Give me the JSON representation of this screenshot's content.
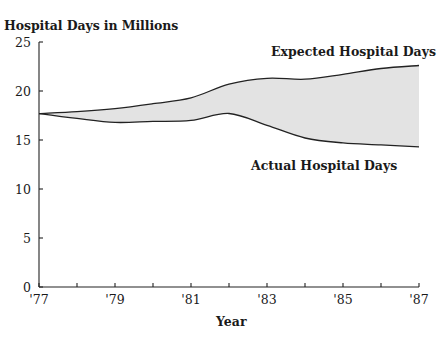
{
  "chart_data": {
    "type": "area",
    "title": "Hospital Days in Millions",
    "xlabel": "Year",
    "ylabel": "Hospital Days in Millions",
    "x": [
      "'77",
      "'78",
      "'79",
      "'80",
      "'81",
      "'82",
      "'83",
      "'84",
      "'85",
      "'86",
      "'87"
    ],
    "xticks": [
      "'77",
      "'79",
      "'81",
      "'83",
      "'85",
      "'87"
    ],
    "yticks": [
      0,
      5,
      10,
      15,
      20,
      25
    ],
    "ylim": [
      0,
      25
    ],
    "grid": false,
    "legend": "inline annotations",
    "series": [
      {
        "name": "Expected Hospital Days",
        "values": [
          17.7,
          17.9,
          18.2,
          18.7,
          19.3,
          20.7,
          21.3,
          21.2,
          21.7,
          22.3,
          22.6
        ]
      },
      {
        "name": "Actual Hospital Days",
        "values": [
          17.7,
          17.2,
          16.8,
          16.9,
          17.0,
          17.7,
          16.5,
          15.2,
          14.7,
          14.5,
          14.3
        ]
      }
    ],
    "fill_between": {
      "color": "#e2e2e2",
      "description": "Shaded gap between expected and actual hospital days"
    }
  },
  "labels": {
    "title": "Hospital Days in Millions",
    "expected": "Expected Hospital Days",
    "actual": "Actual Hospital Days",
    "x_axis": "Year"
  },
  "ticks": {
    "y": [
      "25",
      "20",
      "15",
      "10",
      "5",
      "0"
    ],
    "x": [
      "'77",
      "'79",
      "'81",
      "'83",
      "'85",
      "'87"
    ]
  }
}
